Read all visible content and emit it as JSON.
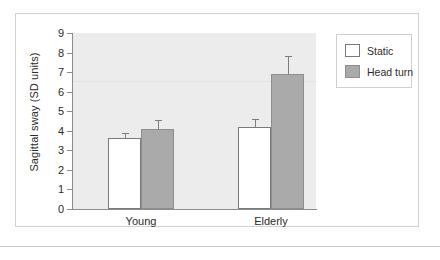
{
  "chart_data": {
    "type": "bar",
    "title": "",
    "xlabel": "",
    "ylabel": "Sagittal sway (SD units)",
    "categories": [
      "Young",
      "Elderly"
    ],
    "ylim": [
      0,
      9
    ],
    "yticks": [
      0,
      1,
      2,
      3,
      4,
      5,
      6,
      7,
      8,
      9
    ],
    "ytick_labels": [
      "0",
      "1",
      "2",
      "3",
      "4",
      "5",
      "6",
      "7",
      "8",
      "9"
    ],
    "grid": false,
    "legend_position": "top-right",
    "series": [
      {
        "name": "Static",
        "color": "#ffffff",
        "edge_color": "#7a7a7a",
        "values": [
          3.65,
          4.2
        ],
        "errors": [
          0.25,
          0.4
        ]
      },
      {
        "name": "Head turn",
        "color": "#aaaaaa",
        "edge_color": "#8e8e8e",
        "values": [
          4.1,
          6.9
        ],
        "errors": [
          0.45,
          0.9
        ]
      }
    ]
  },
  "legend": {
    "entries": [
      {
        "label": "Static"
      },
      {
        "label": "Head turn"
      }
    ]
  },
  "colors": {
    "plot_background": "#ececec",
    "axis": "#8c8c8c",
    "text": "#2b2b2b",
    "card_border": "#d2d2d2"
  }
}
